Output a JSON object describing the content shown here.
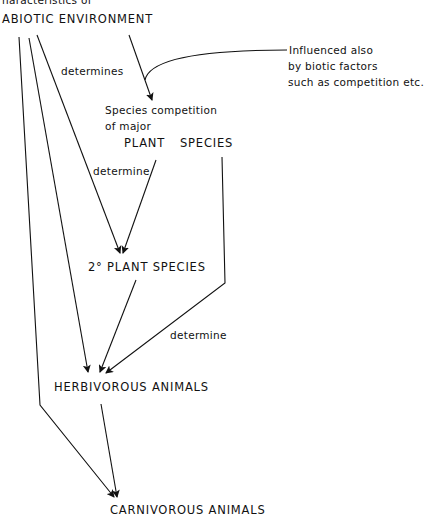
{
  "diagram": {
    "top_fragment": "haracteristics of",
    "nodes": {
      "abiotic": "ABIOTIC ENVIRONMENT",
      "competition_line1": "Species competition",
      "competition_line2": "of major",
      "plant_species_a": "PLANT",
      "plant_species_b": "SPECIES",
      "secondary_plant": "2° PLANT SPECIES",
      "herbivorous": "HERBIVOROUS ANIMALS",
      "carnivorous": "CARNIVOROUS ANIMALS"
    },
    "annotation": {
      "line1": "Influenced also",
      "line2": "by biotic factors",
      "line3": "such as competition etc."
    },
    "edge_labels": {
      "determines": "determines",
      "determine_1": "determine",
      "determine_2": "determine"
    },
    "colors": {
      "ink": "#111111",
      "background": "#ffffff"
    }
  }
}
